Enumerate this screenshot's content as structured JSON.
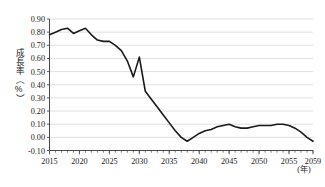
{
  "chart_data": {
    "type": "line",
    "title": "",
    "subtitle": "",
    "xlabel": "(年)",
    "ylabel": "成長率（%）",
    "xlim": [
      2015,
      2059
    ],
    "ylim": [
      -0.1,
      0.9
    ],
    "grid": true,
    "grid_axis": "y",
    "legend": false,
    "legend_position": "none",
    "y_ticks": [
      0.9,
      0.8,
      0.7,
      0.6,
      0.5,
      0.4,
      0.3,
      0.2,
      0.1,
      0.0,
      -0.1
    ],
    "y_tick_labels": [
      "0.90",
      "0.80",
      "0.70",
      "0.60",
      "0.50",
      "0.40",
      "0.30",
      "0.20",
      "0.10",
      "0.00",
      "-0.10"
    ],
    "x_ticks": [
      2015,
      2020,
      2025,
      2030,
      2035,
      2040,
      2045,
      2050,
      2055,
      2059
    ],
    "x_tick_labels": [
      "2015",
      "2020",
      "2025",
      "2030",
      "2035",
      "2040",
      "2045",
      "2050",
      "2055",
      "2059"
    ],
    "x_minor_tick_interval": 1,
    "series": [
      {
        "name": "成長率",
        "color": "#1a1a1a",
        "x": [
          2015,
          2016,
          2017,
          2018,
          2019,
          2020,
          2021,
          2022,
          2023,
          2024,
          2025,
          2026,
          2027,
          2028,
          2029,
          2030,
          2031,
          2032,
          2033,
          2034,
          2035,
          2036,
          2037,
          2038,
          2039,
          2040,
          2041,
          2042,
          2043,
          2044,
          2045,
          2046,
          2047,
          2048,
          2049,
          2050,
          2051,
          2052,
          2053,
          2054,
          2055,
          2056,
          2057,
          2058,
          2059
        ],
        "values": [
          0.78,
          0.8,
          0.82,
          0.83,
          0.79,
          0.81,
          0.83,
          0.78,
          0.74,
          0.73,
          0.73,
          0.7,
          0.66,
          0.58,
          0.46,
          0.61,
          0.35,
          0.29,
          0.23,
          0.17,
          0.11,
          0.05,
          0.0,
          -0.03,
          0.0,
          0.03,
          0.05,
          0.06,
          0.08,
          0.09,
          0.1,
          0.08,
          0.07,
          0.07,
          0.08,
          0.09,
          0.09,
          0.09,
          0.1,
          0.1,
          0.09,
          0.07,
          0.04,
          0.0,
          -0.03
        ]
      }
    ]
  },
  "axes": {
    "y_title": "成長率（%）",
    "x_unit_label": "(年)"
  }
}
